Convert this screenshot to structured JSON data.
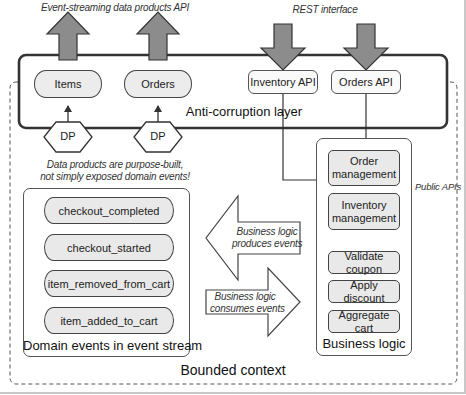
{
  "diagram": {
    "top_labels": {
      "event_streaming_api": "Event-streaming data products API",
      "rest_interface": "REST interface"
    },
    "anti_corruption_layer": {
      "label": "Anti-corruption layer",
      "event_products": [
        {
          "label": "Items"
        },
        {
          "label": "Orders"
        }
      ],
      "rest_apis": [
        {
          "label": "Inventory API"
        },
        {
          "label": "Orders API"
        }
      ]
    },
    "data_products": [
      {
        "label": "DP"
      },
      {
        "label": "DP"
      }
    ],
    "data_products_note": {
      "line1": "Data products are purpose-built,",
      "line2": "not simply exposed domain events!"
    },
    "domain_events": {
      "title": "Domain events in event stream",
      "events": [
        {
          "label": "checkout_completed"
        },
        {
          "label": "checkout_started"
        },
        {
          "label": "item_removed_from_cart"
        },
        {
          "label": "item_added_to_cart"
        }
      ]
    },
    "flow_arrows": {
      "produces": {
        "line1": "Business logic",
        "line2": "produces events"
      },
      "consumes": {
        "line1": "Business logic",
        "line2": "consumes events"
      }
    },
    "business_logic": {
      "title": "Business logic",
      "public_apis_label": "Public APIs",
      "public_components": [
        {
          "line1": "Order",
          "line2": "management"
        },
        {
          "line1": "Inventory",
          "line2": "management"
        }
      ],
      "internal_components": [
        {
          "label": "Validate coupon"
        },
        {
          "label": "Apply discount"
        },
        {
          "label": "Aggregate cart"
        }
      ]
    },
    "bounded_context": {
      "label": "Bounded context"
    },
    "colors": {
      "arrow_fill": "#8c8c8c",
      "box_fill": "#e9e9e9",
      "border_dark": "#333333"
    }
  }
}
